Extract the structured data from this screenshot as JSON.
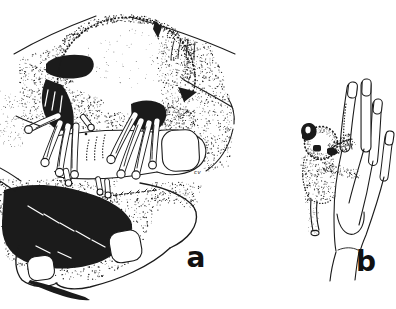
{
  "figure": {
    "panel_a_label": "a",
    "panel_b_label": "b",
    "artist_signature": "cv",
    "ink_color": "#1b1b1b",
    "background_color": "#ffffff"
  }
}
